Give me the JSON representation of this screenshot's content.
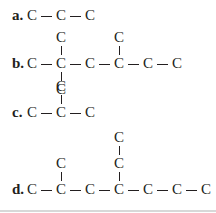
{
  "labels": {
    "a": "a.",
    "b": "b.",
    "c": "c.",
    "d": "d."
  },
  "atom": "C",
  "structures": {
    "a": {
      "main_chain": 3,
      "branches": []
    },
    "b": {
      "main_chain": 6,
      "branches": [
        {
          "position": 2,
          "direction": "up",
          "length": 1
        },
        {
          "position": 4,
          "direction": "up",
          "length": 1
        },
        {
          "position": 2,
          "direction": "down",
          "length": 1
        }
      ]
    },
    "c": {
      "main_chain": 3,
      "branches": [
        {
          "position": 2,
          "direction": "up",
          "length": 1
        }
      ]
    },
    "d": {
      "main_chain": 7,
      "branches": [
        {
          "position": 2,
          "direction": "up",
          "length": 1
        },
        {
          "position": 4,
          "direction": "up",
          "length": 2
        }
      ]
    }
  }
}
